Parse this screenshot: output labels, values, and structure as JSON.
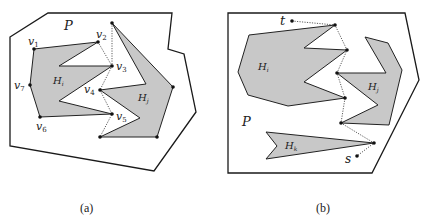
{
  "figure": {
    "panels": [
      {
        "id": "a",
        "caption": "(a)",
        "polygon_label": "P",
        "holes": [
          {
            "label": "H",
            "subscript": "i"
          },
          {
            "label": "H",
            "subscript": "j"
          }
        ],
        "vertices": [
          {
            "name": "v",
            "sub": "1"
          },
          {
            "name": "v",
            "sub": "2"
          },
          {
            "name": "v",
            "sub": "3"
          },
          {
            "name": "v",
            "sub": "4"
          },
          {
            "name": "v",
            "sub": "5"
          },
          {
            "name": "v",
            "sub": "6"
          },
          {
            "name": "v",
            "sub": "7"
          }
        ]
      },
      {
        "id": "b",
        "caption": "(b)",
        "polygon_label": "P",
        "holes": [
          {
            "label": "H",
            "subscript": "i"
          },
          {
            "label": "H",
            "subscript": "j"
          },
          {
            "label": "H",
            "subscript": "k"
          }
        ],
        "endpoints": {
          "start": "s",
          "target": "t"
        }
      }
    ],
    "colors": {
      "hole_fill": "#c8c8c8",
      "stroke": "#1a1a1a",
      "background": "#ffffff"
    }
  }
}
